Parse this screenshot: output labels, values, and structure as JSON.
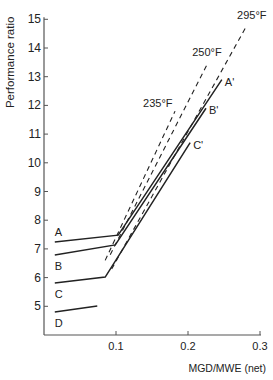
{
  "chart_data": {
    "type": "line",
    "title": "",
    "xlabel": "MGD/MWE (net)",
    "ylabel": "Performance ratio",
    "xlim": [
      0,
      0.3
    ],
    "ylim": [
      4,
      15
    ],
    "x_ticks": [
      "0.1",
      "0.2",
      "0.3"
    ],
    "x_tick_values": [
      0.1,
      0.2,
      0.3
    ],
    "y_ticks": [
      "5",
      "6",
      "7",
      "8",
      "9",
      "10",
      "11",
      "12",
      "13",
      "14",
      "15"
    ],
    "y_tick_values": [
      5,
      6,
      7,
      8,
      9,
      10,
      11,
      12,
      13,
      14,
      15
    ],
    "grid": false,
    "legend": "none (inline labels)",
    "series": [
      {
        "name": "A",
        "end_label": "A'",
        "style": "solid",
        "points": [
          [
            0.015,
            7.24
          ],
          [
            0.103,
            7.48
          ],
          [
            0.247,
            12.9
          ]
        ]
      },
      {
        "name": "B",
        "end_label": "B'",
        "style": "solid",
        "points": [
          [
            0.015,
            6.79
          ],
          [
            0.099,
            7.14
          ],
          [
            0.225,
            11.9
          ]
        ]
      },
      {
        "name": "C",
        "end_label": "C'",
        "style": "solid",
        "points": [
          [
            0.015,
            5.81
          ],
          [
            0.085,
            6.02
          ],
          [
            0.203,
            10.7
          ]
        ]
      },
      {
        "name": "D",
        "end_label": "",
        "style": "solid",
        "points": [
          [
            0.015,
            4.8
          ],
          [
            0.074,
            5.01
          ]
        ]
      },
      {
        "name": "235°F",
        "style": "dashed",
        "points": [
          [
            0.085,
            6.6
          ],
          [
            0.182,
            11.8
          ]
        ]
      },
      {
        "name": "250°F",
        "style": "dashed",
        "points": [
          [
            0.092,
            6.8
          ],
          [
            0.228,
            13.5
          ]
        ]
      },
      {
        "name": "295°F",
        "style": "dashed",
        "points": [
          [
            0.094,
            6.3
          ],
          [
            0.282,
            14.8
          ]
        ]
      }
    ]
  }
}
